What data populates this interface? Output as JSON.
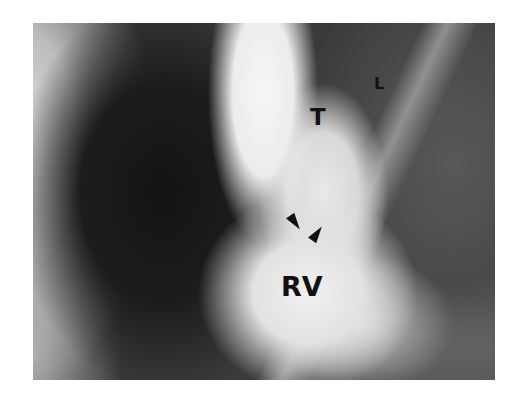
{
  "figure": {
    "type": "angiogram",
    "labels": {
      "t": "T",
      "l": "L",
      "rv": "RV"
    },
    "arrowheads": 2
  }
}
